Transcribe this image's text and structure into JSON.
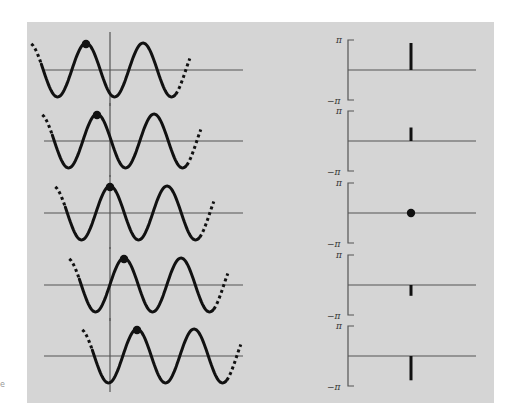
{
  "figure": {
    "background": "#d5d5d5",
    "ink": "#111111",
    "axis_color": "#555555",
    "stray_mark": "e"
  },
  "chart_data": {
    "type": "diagram",
    "title": "",
    "phase_axis": {
      "top_label": "π",
      "bottom_label": "−π",
      "ylim": [
        -3.1416,
        3.1416
      ]
    },
    "rows": [
      {
        "row": 1,
        "wave_shift_px": -24,
        "phase_fraction_of_pi": 0.5,
        "marker": "stick"
      },
      {
        "row": 2,
        "wave_shift_px": -13,
        "phase_fraction_of_pi": 0.25,
        "marker": "stick"
      },
      {
        "row": 3,
        "wave_shift_px": 0,
        "phase_fraction_of_pi": 0.0,
        "marker": "dot"
      },
      {
        "row": 4,
        "wave_shift_px": 14,
        "phase_fraction_of_pi": -0.2,
        "marker": "stick"
      },
      {
        "row": 5,
        "wave_shift_px": 27,
        "phase_fraction_of_pi": -0.45,
        "marker": "stick"
      }
    ]
  }
}
